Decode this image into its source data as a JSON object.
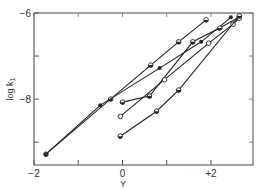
{
  "chart_data": {
    "type": "line",
    "title": "",
    "xlabel": "Y",
    "ylabel": "log k1",
    "xlim": [
      -2.0,
      2.95
    ],
    "ylim": [
      -9.53,
      -6.0
    ],
    "x_ticks": [
      -2,
      -1,
      0,
      1,
      2
    ],
    "x_tick_labels": [
      "-2",
      "",
      "0",
      "",
      "+2"
    ],
    "y_ticks": [
      -6,
      -7,
      -8,
      -9
    ],
    "y_tick_labels": [
      "-6",
      "",
      "-8",
      ""
    ],
    "grid": false,
    "legend": null,
    "series": [
      {
        "name": "series-1 (steepest-left, half-filled markers)",
        "marker": "half",
        "x": [
          -1.73,
          -0.27,
          0.64,
          1.27,
          1.89
        ],
        "y": [
          -9.28,
          -8.0,
          -7.21,
          -6.67,
          -6.16
        ]
      },
      {
        "name": "series-2 (filled markers)",
        "marker": "filled",
        "x": [
          -1.73,
          -0.5,
          0.84,
          1.78,
          2.45
        ],
        "y": [
          -9.28,
          -8.14,
          -7.28,
          -6.67,
          -6.1
        ]
      },
      {
        "name": "series-3 (half-filled markers)",
        "marker": "half",
        "x": [
          0.0,
          0.61,
          1.59,
          2.2,
          2.64
        ],
        "y": [
          -8.07,
          -7.93,
          -6.67,
          -6.35,
          -6.09
        ]
      },
      {
        "name": "series-4 (open markers)",
        "marker": "open",
        "x": [
          -0.05,
          0.95,
          1.95,
          2.5,
          2.64
        ],
        "y": [
          -8.4,
          -7.55,
          -6.7,
          -6.26,
          -6.12
        ]
      },
      {
        "name": "series-5 (half-filled markers, lowest)",
        "marker": "half",
        "x": [
          -0.05,
          0.77,
          1.27,
          2.64
        ],
        "y": [
          -8.86,
          -8.28,
          -7.79,
          -6.07
        ]
      }
    ]
  },
  "axes": {
    "x_label": "Y",
    "y_label": "log k",
    "y_label_sub": "1",
    "x_tick_labels": [
      "-2",
      "0",
      "+2"
    ],
    "y_tick_labels": [
      "-6",
      "-8"
    ]
  }
}
